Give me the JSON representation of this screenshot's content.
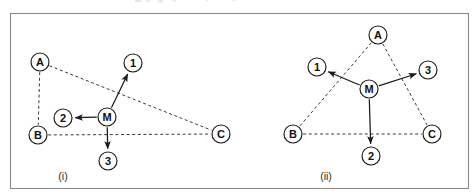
{
  "figure": {
    "background_color": "#ffffff",
    "border_color": "#8a8a8a",
    "node_stroke_color": "#1a1a1a",
    "node_fill_color": "#ffffff",
    "solid_edge_color": "#1a1a1a",
    "dashed_edge_color": "#3a3a3a",
    "panel_count": 2
  },
  "panels": [
    {
      "id": "panel-i",
      "caption": "(i)",
      "caption_x": 63,
      "caption_y": 176,
      "nodes": [
        {
          "id": "A",
          "label": "A",
          "x": 40,
          "y": 62,
          "r": 9
        },
        {
          "id": "B",
          "label": "B",
          "x": 38,
          "y": 135,
          "r": 9
        },
        {
          "id": "C",
          "label": "C",
          "x": 221,
          "y": 134,
          "r": 9
        },
        {
          "id": "M",
          "label": "M",
          "x": 107,
          "y": 117,
          "r": 9
        },
        {
          "id": "N1",
          "label": "1",
          "x": 133,
          "y": 63,
          "r": 9
        },
        {
          "id": "N2",
          "label": "2",
          "x": 63,
          "y": 118,
          "r": 9
        },
        {
          "id": "N3",
          "label": "3",
          "x": 108,
          "y": 161,
          "r": 9
        }
      ],
      "edges": [
        {
          "from": "A",
          "to": "B",
          "style": "dashed",
          "arrow": false
        },
        {
          "from": "A",
          "to": "C",
          "style": "dashed",
          "arrow": false
        },
        {
          "from": "B",
          "to": "C",
          "style": "dashed",
          "arrow": false
        },
        {
          "from": "M",
          "to": "N1",
          "style": "solid",
          "arrow": true
        },
        {
          "from": "M",
          "to": "N2",
          "style": "solid",
          "arrow": true
        },
        {
          "from": "M",
          "to": "N3",
          "style": "solid",
          "arrow": true
        }
      ]
    },
    {
      "id": "panel-ii",
      "caption": "(ii)",
      "caption_x": 326,
      "caption_y": 176,
      "nodes": [
        {
          "id": "A",
          "label": "A",
          "x": 378,
          "y": 35,
          "r": 9
        },
        {
          "id": "B",
          "label": "B",
          "x": 293,
          "y": 134,
          "r": 9
        },
        {
          "id": "C",
          "label": "C",
          "x": 432,
          "y": 134,
          "r": 9
        },
        {
          "id": "M",
          "label": "M",
          "x": 369,
          "y": 89,
          "r": 9
        },
        {
          "id": "N1",
          "label": "1",
          "x": 317,
          "y": 67,
          "r": 9
        },
        {
          "id": "N2",
          "label": "2",
          "x": 371,
          "y": 156,
          "r": 9
        },
        {
          "id": "N3",
          "label": "3",
          "x": 428,
          "y": 70,
          "r": 9
        }
      ],
      "edges": [
        {
          "from": "A",
          "to": "B",
          "style": "dashed",
          "arrow": false
        },
        {
          "from": "A",
          "to": "C",
          "style": "dashed",
          "arrow": false
        },
        {
          "from": "B",
          "to": "C",
          "style": "dashed",
          "arrow": false
        },
        {
          "from": "M",
          "to": "N1",
          "style": "solid",
          "arrow": true
        },
        {
          "from": "M",
          "to": "N2",
          "style": "solid",
          "arrow": true
        },
        {
          "from": "M",
          "to": "N3",
          "style": "solid",
          "arrow": true
        }
      ]
    }
  ],
  "frame": {
    "x": 10,
    "y": 13,
    "width": 458,
    "height": 175
  }
}
